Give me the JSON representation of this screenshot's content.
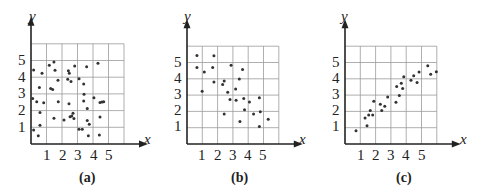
{
  "chart_data": [
    {
      "type": "scatter",
      "panel": "(a)",
      "title": "",
      "caption": "(a)",
      "xlabel": "x",
      "ylabel": "y",
      "xticks": [
        "1",
        "2",
        "3",
        "4",
        "5"
      ],
      "yticks": [
        "1",
        "2",
        "3",
        "4",
        "5"
      ],
      "xlim": [
        0,
        6
      ],
      "ylim": [
        0,
        6
      ],
      "grid": true,
      "description": "No correlation (random scatter)",
      "points": [
        [
          0.17,
          4.43
        ],
        [
          1.18,
          4.71
        ],
        [
          1.48,
          4.91
        ],
        [
          1.55,
          4.41
        ],
        [
          0.71,
          4.23
        ],
        [
          2.41,
          4.39
        ],
        [
          2.47,
          4.23
        ],
        [
          2.82,
          4.67
        ],
        [
          3.59,
          4.63
        ],
        [
          4.32,
          4.83
        ],
        [
          1.74,
          3.81
        ],
        [
          2.37,
          3.87
        ],
        [
          2.58,
          3.75
        ],
        [
          3.1,
          3.91
        ],
        [
          3.4,
          3.59
        ],
        [
          0.54,
          3.39
        ],
        [
          1.27,
          3.33
        ],
        [
          1.4,
          3.27
        ],
        [
          0.11,
          2.73
        ],
        [
          0.37,
          2.53
        ],
        [
          0.82,
          2.47
        ],
        [
          1.76,
          2.53
        ],
        [
          2.45,
          2.41
        ],
        [
          3.42,
          2.98
        ],
        [
          3.4,
          2.57
        ],
        [
          4.06,
          2.77
        ],
        [
          4.45,
          2.49
        ],
        [
          4.58,
          2.51
        ],
        [
          4.69,
          2.53
        ],
        [
          0.58,
          1.89
        ],
        [
          1.48,
          1.54
        ],
        [
          2.13,
          1.44
        ],
        [
          2.52,
          1.63
        ],
        [
          2.63,
          1.68
        ],
        [
          2.71,
          1.84
        ],
        [
          2.77,
          1.52
        ],
        [
          3.63,
          2.13
        ],
        [
          4.45,
          1.62
        ],
        [
          3.63,
          1.4
        ],
        [
          3.76,
          1.18
        ],
        [
          0.58,
          1.12
        ],
        [
          0.17,
          0.84
        ],
        [
          0.47,
          0.5
        ],
        [
          3.1,
          0.88
        ],
        [
          3.31,
          0.88
        ],
        [
          3.7,
          0.5
        ],
        [
          4.41,
          0.54
        ]
      ]
    },
    {
      "type": "scatter",
      "panel": "(b)",
      "title": "",
      "caption": "(b)",
      "xlabel": "x",
      "ylabel": "y",
      "xticks": [
        "1",
        "2",
        "3",
        "4",
        "5"
      ],
      "yticks": [
        "1",
        "2",
        "3",
        "4",
        "5"
      ],
      "xlim": [
        0,
        6
      ],
      "ylim": [
        0,
        6
      ],
      "grid": true,
      "description": "Negative correlation",
      "points": [
        [
          0.65,
          5.43
        ],
        [
          1.76,
          5.41
        ],
        [
          0.65,
          4.69
        ],
        [
          1.13,
          4.41
        ],
        [
          1.68,
          4.69
        ],
        [
          2.88,
          4.83
        ],
        [
          3.63,
          4.57
        ],
        [
          1.76,
          3.81
        ],
        [
          2.43,
          3.87
        ],
        [
          2.33,
          3.65
        ],
        [
          3.42,
          3.99
        ],
        [
          0.99,
          3.23
        ],
        [
          3.18,
          3.37
        ],
        [
          2.66,
          3.17
        ],
        [
          2.81,
          2.73
        ],
        [
          3.21,
          2.69
        ],
        [
          3.71,
          2.79
        ],
        [
          4.08,
          2.57
        ],
        [
          4.73,
          2.83
        ],
        [
          3.76,
          2.1
        ],
        [
          2.43,
          1.84
        ],
        [
          4.35,
          1.84
        ],
        [
          4.79,
          1.98
        ],
        [
          3.46,
          1.38
        ],
        [
          5.31,
          1.52
        ],
        [
          4.73,
          1.08
        ]
      ]
    },
    {
      "type": "scatter",
      "panel": "(c)",
      "title": "",
      "caption": "(c)",
      "xlabel": "x",
      "ylabel": "y",
      "xticks": [
        "1",
        "2",
        "3",
        "4",
        "5"
      ],
      "yticks": [
        "1",
        "2",
        "3",
        "4",
        "5"
      ],
      "xlim": [
        0,
        6
      ],
      "ylim": [
        0,
        6
      ],
      "grid": true,
      "description": "Positive correlation",
      "points": [
        [
          0.72,
          0.82
        ],
        [
          1.44,
          1.12
        ],
        [
          1.31,
          1.6
        ],
        [
          1.55,
          1.78
        ],
        [
          1.65,
          2.05
        ],
        [
          1.81,
          1.78
        ],
        [
          1.88,
          2.63
        ],
        [
          2.4,
          2.05
        ],
        [
          2.31,
          2.44
        ],
        [
          2.6,
          2.32
        ],
        [
          2.79,
          2.89
        ],
        [
          3.33,
          2.56
        ],
        [
          3.55,
          2.98
        ],
        [
          3.38,
          3.52
        ],
        [
          3.68,
          3.73
        ],
        [
          3.77,
          3.4
        ],
        [
          3.84,
          4.13
        ],
        [
          4.31,
          3.91
        ],
        [
          4.49,
          4.19
        ],
        [
          4.71,
          3.78
        ],
        [
          4.84,
          4.42
        ],
        [
          5.41,
          4.8
        ],
        [
          5.6,
          4.28
        ],
        [
          5.97,
          4.43
        ]
      ]
    }
  ]
}
